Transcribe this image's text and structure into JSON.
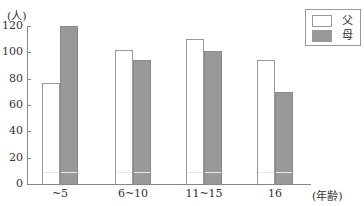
{
  "chart_data": {
    "type": "bar",
    "title": "",
    "ylabel": "(人)",
    "xlabel": "(年齢)",
    "categories": [
      "~5",
      "6~10",
      "11~15",
      "16"
    ],
    "series": [
      {
        "name": "父",
        "color": "#ffffff",
        "values": [
          77,
          102,
          110,
          94
        ]
      },
      {
        "name": "母",
        "color": "#999999",
        "values": [
          120,
          94,
          101,
          70
        ]
      }
    ],
    "ylim": [
      0,
      120
    ],
    "yticks": [
      0,
      20,
      40,
      60,
      80,
      100,
      120
    ],
    "grid": false,
    "legend_position": "top-right"
  },
  "axis": {
    "y_unit": "(人)",
    "x_unit": "(年齢)",
    "yticks": [
      "0",
      "20",
      "40",
      "60",
      "80",
      "100",
      "120"
    ]
  },
  "categories": [
    "~5",
    "6~10",
    "11~15",
    "16"
  ],
  "legend": {
    "father": "父",
    "mother": "母"
  }
}
